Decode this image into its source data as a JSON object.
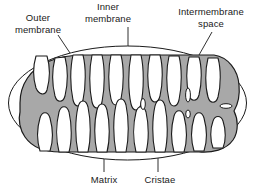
{
  "figure": {
    "background_color": "#ffffff",
    "line_color": "#1a1a1a",
    "matrix_fill": "#a8a8a8",
    "intermembrane_fill": "#ffffff",
    "cristae_fill": "#ffffff"
  },
  "labels": {
    "outer_membrane": {
      "line1": "Outer",
      "line2": "membrane"
    },
    "inner_membrane": {
      "line1": "Inner",
      "line2": "membrane"
    },
    "intermembrane_space": {
      "line1": "Intermembrane",
      "line2": "space"
    },
    "matrix": {
      "line1": "Matrix"
    },
    "cristae": {
      "line1": "Cristae"
    }
  }
}
